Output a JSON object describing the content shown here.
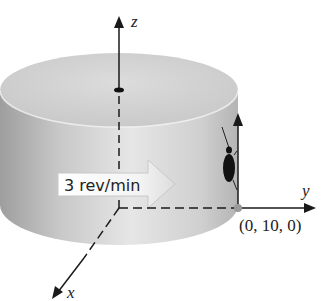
{
  "figure": {
    "axes": {
      "x_label": "x",
      "y_label": "y",
      "z_label": "z"
    },
    "rotation_label": "3 rev/min",
    "point_label": "(0, 10, 0)",
    "colors": {
      "cylinder_light": "#e4e4e4",
      "cylinder_dark": "#a8a8a8",
      "top_face": "#d2d2d2",
      "axis": "#1a1a1a",
      "point_marker": "#9a9a9a",
      "bug": "#111111"
    }
  }
}
